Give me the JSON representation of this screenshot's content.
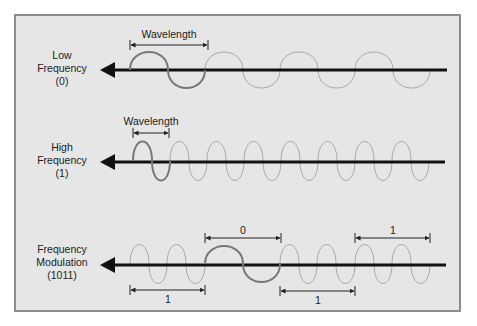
{
  "diagram": {
    "title": "",
    "colors": {
      "background": "#e6e6e6",
      "frame_border": "#8c8c8c",
      "axis_arrow": "#111111",
      "highlight_wave": "#777777",
      "faint_wave": "#a8a8a8",
      "text": "#222222"
    },
    "rows": [
      {
        "id": "low-frequency",
        "label_lines": [
          "Low",
          "Frequency",
          "(0)"
        ],
        "dimension_label": "Wavelength",
        "highlighted_cycles": 1,
        "total_cycles": 4
      },
      {
        "id": "high-frequency",
        "label_lines": [
          "High",
          "Frequency",
          "(1)"
        ],
        "dimension_label": "Wavelength",
        "highlighted_cycles": 1,
        "total_cycles": 8
      },
      {
        "id": "frequency-modulation",
        "label_lines": [
          "Frequency",
          "Modulation",
          "(1011)"
        ],
        "bit_segments": [
          {
            "bit": "1",
            "label": "1",
            "marker_position": "below"
          },
          {
            "bit": "0",
            "label": "0",
            "marker_position": "above"
          },
          {
            "bit": "1",
            "label": "1",
            "marker_position": "below"
          },
          {
            "bit": "1",
            "label": "1",
            "marker_position": "above"
          }
        ]
      }
    ]
  }
}
